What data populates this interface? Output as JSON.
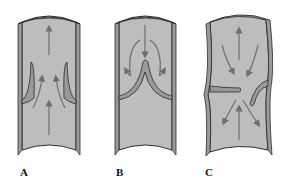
{
  "figure": {
    "panels": [
      {
        "id": "A",
        "label": "A",
        "depiction": "open-vein-valve",
        "flow": "upward-through-valve"
      },
      {
        "id": "B",
        "label": "B",
        "depiction": "closed-vein-valve",
        "flow": "reflux-into-valve-cusps"
      },
      {
        "id": "C",
        "label": "C",
        "depiction": "incompetent-vein-valve",
        "flow": "bidirectional-reflux"
      }
    ],
    "colors": {
      "lumen": "#bdbdbd",
      "wall": "#9a9a9a",
      "outline": "#2b2b2b",
      "arrow": "#6e6e6e",
      "shade": "#8a8a8a"
    }
  }
}
